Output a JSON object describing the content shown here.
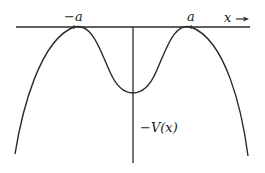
{
  "diagram": {
    "title": "",
    "labels": {
      "neg_a": "−a",
      "pos_a": "a",
      "x_axis": "x",
      "curve": "−V(x)"
    },
    "colors": {
      "stroke": "#2a2a2a",
      "background": "#ffffff"
    },
    "curve": {
      "description": "Inverted double-well potential -V(x): maxima at x = -a and x = a touching the x-axis, local minimum at x = 0, diverging downward for |x| > a",
      "maxima": [
        "-a",
        "a"
      ],
      "minimum": "0"
    }
  }
}
